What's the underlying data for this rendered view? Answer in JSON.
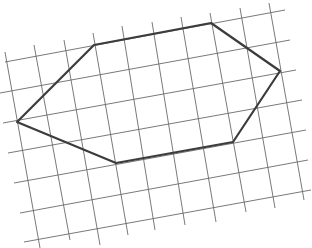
{
  "figure": {
    "grid_color": "#6a6a6a",
    "shape_color": "#3c3c3c",
    "background": "#ffffff"
  },
  "grid": {
    "horizontal_lines": [
      [
        5,
        62,
        285,
        10
      ],
      [
        0,
        93,
        290,
        40
      ],
      [
        3,
        123,
        296,
        70
      ],
      [
        8,
        153,
        302,
        100
      ],
      [
        14,
        183,
        306,
        130
      ],
      [
        20,
        213,
        308,
        160
      ],
      [
        24,
        242,
        311,
        190
      ]
    ],
    "vertical_lines": [
      [
        5,
        52,
        40,
        248
      ],
      [
        34,
        45,
        70,
        240
      ],
      [
        64,
        40,
        100,
        245
      ],
      [
        93,
        33,
        128,
        235
      ],
      [
        122,
        26,
        155,
        230
      ],
      [
        152,
        22,
        185,
        225
      ],
      [
        181,
        17,
        216,
        222
      ],
      [
        210,
        13,
        246,
        212
      ],
      [
        240,
        8,
        275,
        208
      ],
      [
        269,
        3,
        304,
        200
      ]
    ]
  },
  "hexagon": {
    "vertices": [
      {
        "name": "left",
        "x": 17,
        "y": 122
      },
      {
        "name": "top-left",
        "x": 94,
        "y": 45
      },
      {
        "name": "top-right",
        "x": 211,
        "y": 23
      },
      {
        "name": "right",
        "x": 280,
        "y": 71
      },
      {
        "name": "bottom-right",
        "x": 233,
        "y": 142
      },
      {
        "name": "bottom-left",
        "x": 116,
        "y": 163
      }
    ],
    "points": "17,122 94,45 211,23 280,71 233,142 116,163"
  }
}
